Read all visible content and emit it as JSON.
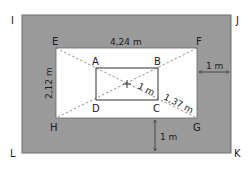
{
  "diagram": {
    "colors": {
      "outer_fill": "#9a9a9a",
      "outer_stroke": "#6f6f6f",
      "inner_fill": "#ffffff",
      "line": "#555555",
      "dashed": "#777777",
      "text": "#1a1a1a"
    },
    "points": {
      "I": "I",
      "J": "J",
      "K": "K",
      "L": "L",
      "E": "E",
      "F": "F",
      "G": "G",
      "H": "H",
      "A": "A",
      "B": "B",
      "C": "C",
      "D": "D"
    },
    "dimensions": {
      "ef_length": "4,24 m",
      "eh_length": "2,12 m",
      "border_right": "1 m",
      "border_bottom": "1 m",
      "center_to_c": "1 m",
      "c_to_g": "1,37 m"
    }
  }
}
